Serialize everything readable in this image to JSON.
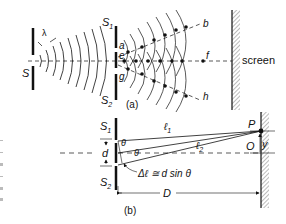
{
  "figure": {
    "panel_a": {
      "caption": "(a)",
      "labels": {
        "lambda": "λ",
        "source": "S",
        "slit1": "S",
        "slit1_sub": "1",
        "slit2": "S",
        "slit2_sub": "2",
        "a": "a",
        "e": "e",
        "g": "g",
        "b": "b",
        "f": "f",
        "h": "h",
        "screen": "screen"
      }
    },
    "panel_b": {
      "caption": "(b)",
      "labels": {
        "slit1": "S",
        "slit1_sub": "1",
        "slit2": "S",
        "slit2_sub": "2",
        "d": "d",
        "theta1": "θ",
        "theta2": "θ",
        "l1": "ℓ",
        "l1_sub": "1",
        "l2": "ℓ",
        "l2_sub": "2",
        "P": "P",
        "O": "O",
        "y": "y",
        "D": "D",
        "path_diff": "Δℓ ≅ d sin θ"
      }
    },
    "colors": {
      "ink": "#111111",
      "background": "#ffffff",
      "hatch": "#555555"
    }
  }
}
